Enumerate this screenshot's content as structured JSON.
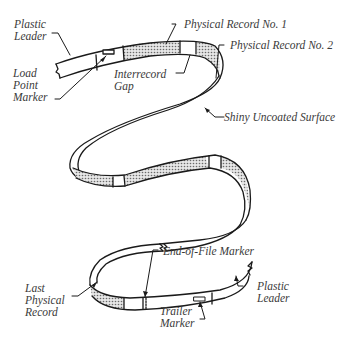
{
  "diagram": {
    "title": "",
    "colors": {
      "stroke": "#1a1a1a",
      "record_fill": "#bdbdbd",
      "label_text": "#3a3a3a",
      "background": "#ffffff"
    },
    "labels": {
      "plastic_leader_start": {
        "line1": "Plastic",
        "line2": "Leader"
      },
      "load_point_marker": {
        "line1": "Load",
        "line2": "Point",
        "line3": "Marker"
      },
      "physical_record_1": "Physical Record No. 1",
      "physical_record_2": "Physical Record No. 2",
      "interrecord_gap": {
        "line1": "Interrecord",
        "line2": "Gap"
      },
      "shiny_uncoated_surface": "Shiny Uncoated Surface",
      "end_of_file_marker": "End-of-File Marker",
      "last_physical_record": {
        "line1": "Last",
        "line2": "Physical",
        "line3": "Record"
      },
      "trailer_marker": {
        "line1": "Trailer",
        "line2": "Marker"
      },
      "plastic_leader_end": {
        "line1": "Plastic",
        "line2": "Leader"
      }
    },
    "nodes": [
      "Plastic Leader",
      "Load Point Marker",
      "Physical Record No. 1",
      "Interrecord Gap",
      "Physical Record No. 2",
      "Shiny Uncoated Surface",
      "Last Physical Record",
      "End-of-File Marker",
      "Trailer Marker",
      "Plastic Leader"
    ]
  }
}
